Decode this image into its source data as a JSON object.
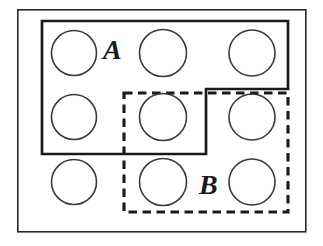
{
  "figure": {
    "type": "set-diagram",
    "width": 323,
    "height": 246,
    "background_color": "#ffffff",
    "stroke_color": "#1a1a1a"
  },
  "universe": {
    "name": "universal-set-rectangle",
    "style": "solid",
    "stroke_width": 1.6,
    "x": 17,
    "y": 9,
    "width": 289,
    "height": 223
  },
  "sets": [
    {
      "id": "A",
      "label": "A",
      "label_x": 103,
      "label_y": 36,
      "style": "solid",
      "stroke_width": 2.6,
      "stroke_color": "#1a1a1a",
      "shape": "step-polygon",
      "points": "42,21 288,21 288,89 206,89 206,154 42,154",
      "contains_circle_ids": [
        1,
        2,
        3,
        4,
        5
      ]
    },
    {
      "id": "B",
      "label": "B",
      "label_x": 199,
      "label_y": 171,
      "style": "dashed",
      "stroke_width": 3.0,
      "stroke_color": "#1a1a1a",
      "dash_pattern": "8,5",
      "shape": "rectangle",
      "points": "124,93 288,93 288,212 124,212",
      "contains_circle_ids": [
        5,
        6,
        8,
        9
      ]
    }
  ],
  "elements": {
    "shape": "circle",
    "count": 9,
    "stroke_color": "#1a1a1a",
    "stroke_width": 1.5,
    "fill": "none",
    "rows": 3,
    "columns": 3,
    "circles": [
      {
        "id": 1,
        "cx": 74,
        "cy": 53,
        "r": 22,
        "row": 1,
        "col": 1,
        "membership": "A-only"
      },
      {
        "id": 2,
        "cx": 163,
        "cy": 53,
        "r": 23,
        "row": 1,
        "col": 2,
        "membership": "A-only"
      },
      {
        "id": 3,
        "cx": 252,
        "cy": 53,
        "r": 23,
        "row": 1,
        "col": 3,
        "membership": "A-only"
      },
      {
        "id": 4,
        "cx": 74,
        "cy": 117,
        "r": 22,
        "row": 2,
        "col": 1,
        "membership": "A-only"
      },
      {
        "id": 5,
        "cx": 163,
        "cy": 117,
        "r": 23,
        "row": 2,
        "col": 2,
        "membership": "A-and-B"
      },
      {
        "id": 6,
        "cx": 252,
        "cy": 117,
        "r": 23,
        "row": 2,
        "col": 3,
        "membership": "B-only"
      },
      {
        "id": 7,
        "cx": 74,
        "cy": 182,
        "r": 22,
        "row": 3,
        "col": 1,
        "membership": "neither"
      },
      {
        "id": 8,
        "cx": 163,
        "cy": 182,
        "r": 23,
        "row": 3,
        "col": 2,
        "membership": "B-only"
      },
      {
        "id": 9,
        "cx": 252,
        "cy": 182,
        "r": 23,
        "row": 3,
        "col": 3,
        "membership": "B-only"
      }
    ]
  },
  "labels": {
    "a": "A",
    "b": "B"
  }
}
